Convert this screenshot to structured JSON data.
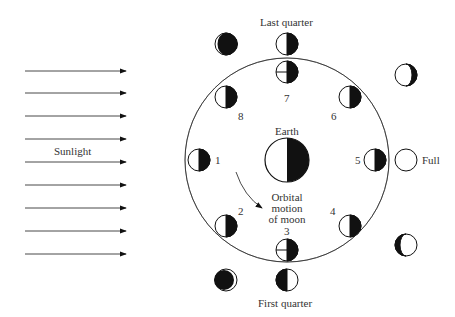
{
  "diagram": {
    "colors": {
      "ink": "#111111",
      "text": "#333333",
      "background": "#ffffff"
    },
    "sunlight": {
      "label": "Sunlight",
      "arrow_count": 9
    },
    "earth": {
      "label": "Earth"
    },
    "orbit": {
      "label_line1": "Orbital",
      "label_line2": "motion",
      "label_line3": "of moon"
    },
    "positions": [
      {
        "number": "1"
      },
      {
        "number": "2"
      },
      {
        "number": "3"
      },
      {
        "number": "4"
      },
      {
        "number": "5"
      },
      {
        "number": "6"
      },
      {
        "number": "7"
      },
      {
        "number": "8"
      }
    ],
    "phase_labels": {
      "last_quarter": "Last quarter",
      "first_quarter": "First quarter",
      "full": "Full"
    }
  }
}
